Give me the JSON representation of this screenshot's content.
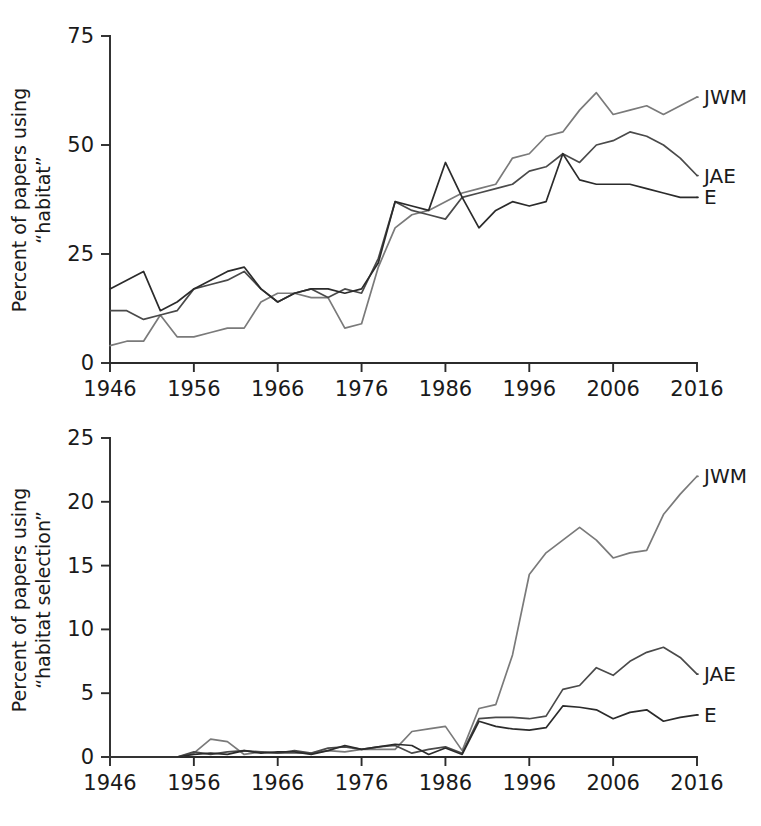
{
  "figure": {
    "background_color": "#ffffff",
    "line_color_dark": "#2b2b2b",
    "line_color_mid": "#4a4a4a",
    "line_color_light": "#7a7a7a",
    "text_color": "#1a1a1a"
  },
  "chart_data": [
    {
      "type": "line",
      "panel": "top",
      "title": "",
      "xlabel": "",
      "ylabel": "Percent of papers using \"habitat\"",
      "ylabel_line1": "Percent of papers using",
      "ylabel_line2": "“habitat”",
      "xlim": [
        1946,
        2016
      ],
      "ylim": [
        0,
        75
      ],
      "grid": false,
      "legend_position": "right-of-line-ends",
      "xticks": [
        1946,
        1956,
        1966,
        1976,
        1986,
        1996,
        2006,
        2016
      ],
      "xticklabels": [
        "1946",
        "1956",
        "1966",
        "1976",
        "1986",
        "1996",
        "2006",
        "2016"
      ],
      "yticks": [
        0,
        25,
        50,
        75
      ],
      "yticklabels": [
        "0",
        "25",
        "50",
        "75"
      ],
      "x": [
        1946,
        1948,
        1950,
        1952,
        1954,
        1956,
        1958,
        1960,
        1962,
        1964,
        1966,
        1968,
        1970,
        1972,
        1974,
        1976,
        1978,
        1980,
        1982,
        1984,
        1986,
        1988,
        1990,
        1992,
        1994,
        1996,
        1998,
        2000,
        2002,
        2004,
        2006,
        2008,
        2010,
        2012,
        2014,
        2016
      ],
      "series": [
        {
          "name": "JWM",
          "color": "#7a7a7a",
          "label": "JWM",
          "label_y_value": 61,
          "values": [
            4,
            5,
            5,
            11,
            6,
            6,
            7,
            8,
            8,
            14,
            16,
            16,
            15,
            15,
            8,
            9,
            22,
            31,
            34,
            35,
            37,
            39,
            40,
            41,
            47,
            48,
            52,
            53,
            58,
            62,
            57,
            58,
            59,
            57,
            59,
            61
          ]
        },
        {
          "name": "JAE",
          "color": "#4a4a4a",
          "label": "JAE",
          "label_y_value": 43,
          "values": [
            12,
            12,
            10,
            11,
            12,
            17,
            18,
            19,
            21,
            17,
            14,
            16,
            17,
            15,
            17,
            16,
            24,
            37,
            35,
            34,
            33,
            38,
            39,
            40,
            41,
            44,
            45,
            48,
            46,
            50,
            51,
            53,
            52,
            50,
            47,
            43
          ]
        },
        {
          "name": "E",
          "color": "#2b2b2b",
          "label": "E",
          "label_y_value": 38,
          "values": [
            17,
            19,
            21,
            12,
            14,
            17,
            19,
            21,
            22,
            17,
            14,
            16,
            17,
            17,
            16,
            17,
            23,
            37,
            36,
            35,
            46,
            38,
            31,
            35,
            37,
            36,
            37,
            48,
            42,
            41,
            41,
            41,
            40,
            39,
            38,
            38
          ]
        }
      ]
    },
    {
      "type": "line",
      "panel": "bottom",
      "title": "",
      "xlabel": "",
      "ylabel": "Percent of papers using \"habitat selection\"",
      "ylabel_line1": "Percent of papers using",
      "ylabel_line2": "“habitat selection”",
      "xlim": [
        1946,
        2016
      ],
      "ylim": [
        0,
        25
      ],
      "grid": false,
      "legend_position": "right-of-line-ends",
      "xticks": [
        1946,
        1956,
        1966,
        1976,
        1986,
        1996,
        2006,
        2016
      ],
      "xticklabels": [
        "1946",
        "1956",
        "1966",
        "1976",
        "1986",
        "1996",
        "2006",
        "2016"
      ],
      "yticks": [
        0,
        5,
        10,
        15,
        20,
        25
      ],
      "yticklabels": [
        "0",
        "5",
        "10",
        "15",
        "20",
        "25"
      ],
      "x": [
        1946,
        1948,
        1950,
        1952,
        1954,
        1956,
        1958,
        1960,
        1962,
        1964,
        1966,
        1968,
        1970,
        1972,
        1974,
        1976,
        1978,
        1980,
        1982,
        1984,
        1986,
        1988,
        1990,
        1992,
        1994,
        1996,
        1998,
        2000,
        2002,
        2004,
        2006,
        2008,
        2010,
        2012,
        2014,
        2016
      ],
      "series": [
        {
          "name": "JWM",
          "color": "#7a7a7a",
          "label": "JWM",
          "label_y_value": 22,
          "values": [
            0,
            0,
            0,
            0,
            0,
            0.3,
            1.4,
            1.2,
            0.2,
            0.4,
            0.3,
            0.3,
            0.3,
            0.5,
            0.4,
            0.6,
            0.6,
            0.6,
            2.0,
            2.2,
            2.4,
            0.5,
            3.8,
            4.1,
            8.0,
            14.3,
            16.0,
            17.0,
            18.0,
            17.0,
            15.6,
            16.0,
            16.2,
            19.0,
            20.6,
            22.0
          ]
        },
        {
          "name": "JAE",
          "color": "#4a4a4a",
          "label": "JAE",
          "label_y_value": 6.5,
          "values": [
            0,
            0,
            0,
            0,
            0,
            0.4,
            0.2,
            0.4,
            0.5,
            0.4,
            0.3,
            0.5,
            0.3,
            0.7,
            0.8,
            0.6,
            0.8,
            0.9,
            0.3,
            0.6,
            0.8,
            0.3,
            3.0,
            3.1,
            3.1,
            3.0,
            3.2,
            5.3,
            5.6,
            7.0,
            6.4,
            7.5,
            8.2,
            8.6,
            7.8,
            6.5
          ]
        },
        {
          "name": "E",
          "color": "#2b2b2b",
          "label": "E",
          "label_y_value": 3.3,
          "values": [
            0,
            0,
            0,
            0,
            0,
            0.2,
            0.3,
            0.2,
            0.5,
            0.3,
            0.4,
            0.4,
            0.2,
            0.5,
            0.9,
            0.6,
            0.8,
            1.0,
            0.9,
            0.2,
            0.7,
            0.2,
            2.8,
            2.4,
            2.2,
            2.1,
            2.3,
            4.0,
            3.9,
            3.7,
            3.0,
            3.5,
            3.7,
            2.8,
            3.1,
            3.3
          ]
        }
      ]
    }
  ]
}
